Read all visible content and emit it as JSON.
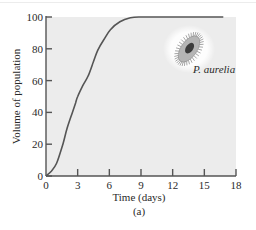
{
  "chart_data": {
    "type": "line",
    "title": "",
    "panel_label": "(a)",
    "xlabel": "Time (days)",
    "ylabel": "Volume of population",
    "xlim": [
      0,
      18
    ],
    "ylim": [
      0,
      100
    ],
    "x_ticks": [
      0,
      3,
      6,
      9,
      12,
      15,
      18
    ],
    "y_ticks": [
      0,
      20,
      40,
      60,
      80,
      100
    ],
    "grid": false,
    "legend": null,
    "annotations": [
      {
        "text": "P. aurelia",
        "x": 13.5,
        "y": 70,
        "style": "italic",
        "note": "image of paramecium organism"
      }
    ],
    "series": [
      {
        "name": "P. aurelia",
        "color": "#555555",
        "x": [
          0,
          0.5,
          1,
          1.6,
          2,
          2.5,
          2.8,
          3,
          3.5,
          4,
          4.5,
          4.9,
          5.5,
          6.1,
          7,
          8,
          9,
          12,
          15,
          16.8
        ],
        "y": [
          0,
          3,
          8,
          20,
          30,
          40,
          46,
          50,
          57,
          63,
          72,
          79,
          86,
          92,
          97,
          99.5,
          100,
          100,
          100,
          100
        ]
      }
    ],
    "colors": {
      "plot_background": "#ececec",
      "curve": "#555555",
      "axis": "#555555",
      "organism": "#8a8a8a",
      "organism_core": "#3c3c3c"
    }
  }
}
